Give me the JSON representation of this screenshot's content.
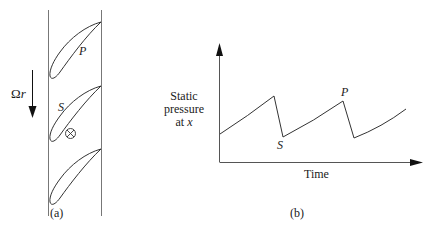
{
  "panel_a": {
    "caption": "(a)",
    "rotation_label": "Ωr",
    "blade_labels": {
      "pressure_side": "P",
      "suction_side": "S"
    },
    "probe_symbol": "⊗",
    "blade_count": 3
  },
  "panel_b": {
    "caption": "(b)",
    "ylabel_lines": [
      "Static",
      "pressure",
      "at x"
    ],
    "xlabel": "Time",
    "point_labels": {
      "peak": "P",
      "trough": "S"
    }
  },
  "chart_data": {
    "type": "line",
    "title": "",
    "xlabel": "Time",
    "ylabel": "Static pressure at x",
    "grid": false,
    "legend": null,
    "series": [
      {
        "name": "static pressure",
        "points": [
          {
            "x": 0.0,
            "y": 0.24
          },
          {
            "x": 0.27,
            "y": 0.55
          },
          {
            "x": 0.32,
            "y": 0.21,
            "label": "S"
          },
          {
            "x": 0.62,
            "y": 0.51,
            "label": "P"
          },
          {
            "x": 0.67,
            "y": 0.2
          },
          {
            "x": 0.93,
            "y": 0.44
          }
        ]
      }
    ],
    "annotations": [
      "P (peak, blade pressure side)",
      "S (trough, blade suction side)"
    ],
    "xlim": [
      0,
      1
    ],
    "ylim": [
      0,
      1
    ],
    "note": "Sawtooth waveform: gradual rise then sharp drop as each blade passes"
  }
}
